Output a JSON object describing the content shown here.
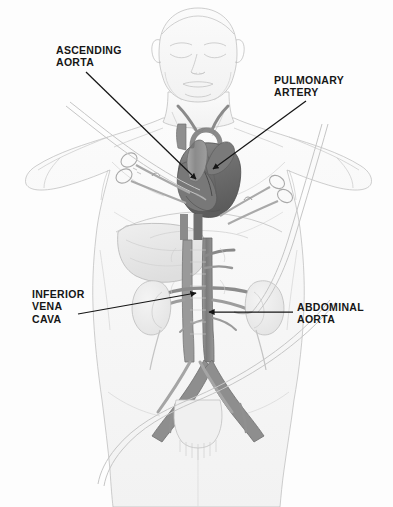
{
  "illustration": {
    "title": "Cardiovascular anatomy with surgical cannulation",
    "style": "pencil sketch medical illustration",
    "background_color": "#fdfdfd",
    "line_color": "#161616",
    "figure": "anterior view of a human torso with head, closed eyes, arms at sides, showing heart, great vessels, liver, kidneys, abdominal aorta and inferior vena cava with surgical clamps and cannula tubing"
  },
  "labels": [
    {
      "id": "ascending-aorta",
      "lines": [
        "ASCENDING",
        "AORTA"
      ],
      "text": "ASCENDING\nAORTA",
      "position": "upper-left"
    },
    {
      "id": "pulmonary-artery",
      "lines": [
        "PULMONARY",
        "ARTERY"
      ],
      "text": "PULMONARY\nARTERY",
      "position": "upper-right"
    },
    {
      "id": "inferior-vena-cava",
      "lines": [
        "INFERIOR",
        "VENA",
        "CAVA"
      ],
      "text": "INFERIOR\nVENA\nCAVA",
      "position": "mid-left"
    },
    {
      "id": "abdominal-aorta",
      "lines": [
        "ABDOMINAL",
        "AORTA"
      ],
      "text": "ABDOMINAL\nAORTA",
      "position": "mid-right"
    }
  ],
  "leader_lines": [
    {
      "id": "leader-ascending-aorta",
      "from": [
        86,
        72
      ],
      "to": [
        196,
        179
      ],
      "arrow": true
    },
    {
      "id": "leader-pulmonary-artery",
      "from": [
        306,
        101
      ],
      "to": [
        213,
        169
      ],
      "arrow": true
    },
    {
      "id": "leader-inferior-vena-cava",
      "from": [
        78,
        314
      ],
      "to": [
        196,
        293
      ],
      "arrow": true
    },
    {
      "id": "leader-abdominal-aorta",
      "from": [
        293,
        312
      ],
      "to": [
        209,
        312
      ],
      "arrow": true
    }
  ],
  "anatomy_parts": [
    "head-with-closed-eyes",
    "neck",
    "shoulders-and-arms",
    "chest",
    "heart",
    "ascending-aorta",
    "pulmonary-artery",
    "superior-vena-cava",
    "liver",
    "diaphragm",
    "left-kidney",
    "right-kidney",
    "renal-arteries",
    "abdominal-aorta",
    "inferior-vena-cava",
    "iliac-bifurcation",
    "pelvis-and-hips"
  ],
  "instruments": [
    {
      "id": "surgical-clamp-left",
      "type": "ring-handled-forceps"
    },
    {
      "id": "surgical-clamp-right",
      "type": "ring-handled-forceps"
    },
    {
      "id": "cannula-tube-upper",
      "type": "perfusion-cannula"
    },
    {
      "id": "cannula-tube-lower",
      "type": "perfusion-cannula"
    }
  ]
}
